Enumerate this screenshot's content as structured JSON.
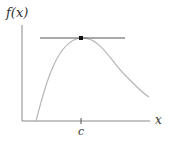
{
  "diagram": {
    "y_axis_label": "f(x)",
    "x_axis_label": "x",
    "tick_label": "c"
  },
  "colors": {
    "axis": "#8a8a8a",
    "curve": "#b5b5b5",
    "tangent": "#555555",
    "point": "#111111"
  }
}
